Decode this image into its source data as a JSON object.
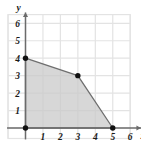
{
  "chart_data": {
    "type": "area",
    "title": "",
    "subtitle": "",
    "xlabel": "x",
    "ylabel": "y",
    "xlim": [
      -0.45,
      7.0
    ],
    "ylim": [
      -0.45,
      7.0
    ],
    "grid": true,
    "grid_step": 1,
    "legend": "none",
    "x_ticks": [
      1,
      2,
      3,
      4,
      5,
      6
    ],
    "y_ticks": [
      1,
      2,
      3,
      4,
      5,
      6
    ],
    "x_tick_labels": [
      "1",
      "2",
      "3",
      "4",
      "5",
      "6"
    ],
    "y_tick_labels": [
      "1",
      "2",
      "3",
      "4",
      "5",
      "6"
    ],
    "series": [
      {
        "name": "feasible region",
        "kind": "polygon",
        "closed": true,
        "points": [
          [
            0,
            0
          ],
          [
            0,
            4
          ],
          [
            3,
            3
          ],
          [
            5,
            0
          ]
        ],
        "fill": "#c9c9c9",
        "fill_opacity": 0.75,
        "stroke": "#6e6e6e"
      }
    ],
    "vertices": [
      {
        "label": "",
        "x": 0,
        "y": 0
      },
      {
        "label": "",
        "x": 0,
        "y": 4
      },
      {
        "label": "",
        "x": 3,
        "y": 3
      },
      {
        "label": "",
        "x": 5,
        "y": 0
      }
    ],
    "colors": {
      "axis": "#6b6b6b",
      "grid": "#e3e3e3",
      "region_fill": "#c9c9c9",
      "region_edge": "#7a7a7a",
      "vertex_dot": "#111111",
      "text": "#1a1a1a",
      "background": "#ffffff"
    },
    "axis_arrows": {
      "x": true,
      "y": true
    }
  }
}
